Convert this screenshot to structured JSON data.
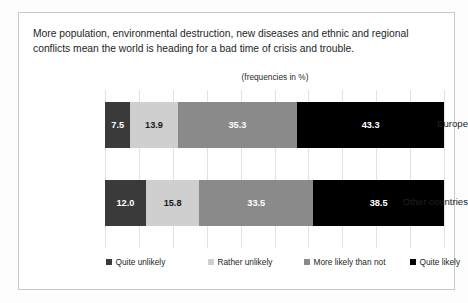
{
  "chart_data": {
    "type": "bar",
    "orientation": "horizontal",
    "stacked": true,
    "stack_mode": "percent",
    "title": "More population, environmental destruction, new diseases and ethnic and regional conflicts mean the world is heading for a bad time of crisis and trouble.",
    "subtitle": "(frequencies in %)",
    "xlabel": "",
    "ylabel": "",
    "xlim": [
      0,
      100
    ],
    "xticks": [
      0,
      10,
      20,
      30,
      40,
      50,
      60,
      70,
      80,
      90,
      100
    ],
    "grid": true,
    "legend_position": "bottom",
    "categories": [
      "Europe",
      "Other countries"
    ],
    "series": [
      {
        "name": "Quite unlikely",
        "color": "#3a3a3a",
        "values": [
          7.5,
          12.0
        ],
        "labels": [
          "7.5",
          "12.0"
        ]
      },
      {
        "name": "Rather unlikely",
        "color": "#cfcfcf",
        "values": [
          13.9,
          15.8
        ],
        "labels": [
          "13.9",
          "15.8"
        ]
      },
      {
        "name": "More likely than not",
        "color": "#8a8a8a",
        "values": [
          35.3,
          33.5
        ],
        "labels": [
          "35.3",
          "33.5"
        ]
      },
      {
        "name": "Quite likely",
        "color": "#000000",
        "values": [
          43.3,
          38.5
        ],
        "labels": [
          "43.3",
          "38.5"
        ]
      }
    ]
  },
  "rows": [
    {
      "label": "Europe",
      "segments": [
        {
          "label": "7.5",
          "value": 7.5
        },
        {
          "label": "13.9",
          "value": 13.9
        },
        {
          "label": "35.3",
          "value": 35.3
        },
        {
          "label": "43.3",
          "value": 43.3
        }
      ]
    },
    {
      "label": "Other countries",
      "segments": [
        {
          "label": "12.0",
          "value": 12.0
        },
        {
          "label": "15.8",
          "value": 15.8
        },
        {
          "label": "33.5",
          "value": 33.5
        },
        {
          "label": "38.5",
          "value": 38.5
        }
      ]
    }
  ],
  "legend": {
    "items": [
      {
        "label": "Quite unlikely"
      },
      {
        "label": "Rather unlikely"
      },
      {
        "label": "More likely than not"
      },
      {
        "label": "Quite likely"
      }
    ]
  }
}
